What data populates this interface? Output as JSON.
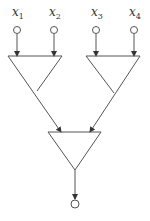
{
  "diagram": {
    "inputs": [
      {
        "var": "x",
        "sub": "1"
      },
      {
        "var": "x",
        "sub": "2"
      },
      {
        "var": "x",
        "sub": "3"
      },
      {
        "var": "x",
        "sub": "4"
      }
    ],
    "colors": {
      "stroke": "#555555",
      "text": "#333333",
      "background": "#ffffff"
    }
  }
}
